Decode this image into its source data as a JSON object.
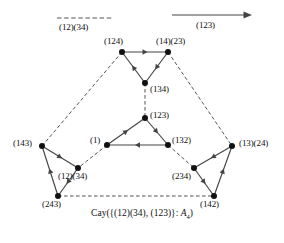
{
  "figure": {
    "caption_prefix": "Cay({(12)(34), (123)}: ",
    "caption_group": "A",
    "caption_sub": "4",
    "caption_suffix": ")",
    "caption_full": "Cay({(12)(34), (123)}: A4)"
  },
  "legend": {
    "dashed": {
      "label": "(12)(34)",
      "style": "dashed-line",
      "meaning": "generator-involution"
    },
    "arrow": {
      "label": "(123)",
      "style": "solid-arrow",
      "meaning": "generator-3-cycle"
    }
  },
  "colors": {
    "edge": "#444444",
    "dashed_edge": "#555555",
    "node": "#111111",
    "text": "#111111",
    "background": "#ffffff"
  },
  "graph": {
    "type": "cayley-graph",
    "group": "A4",
    "vertex_count": 12,
    "vertices": [
      {
        "id": "v124",
        "label": "(124)",
        "x": 122,
        "y": 52,
        "label_x": 104,
        "label_y": 36
      },
      {
        "id": "v1423",
        "label": "(14)(23)",
        "x": 168,
        "y": 52,
        "label_x": 156,
        "label_y": 36
      },
      {
        "id": "v134",
        "label": "(134)",
        "x": 145,
        "y": 83,
        "label_x": 150,
        "label_y": 84
      },
      {
        "id": "v123",
        "label": "(123)",
        "x": 145,
        "y": 118,
        "label_x": 150,
        "label_y": 110
      },
      {
        "id": "v1",
        "label": "(1)",
        "x": 107,
        "y": 145,
        "label_x": 90,
        "label_y": 135
      },
      {
        "id": "v132",
        "label": "(132)",
        "x": 168,
        "y": 145,
        "label_x": 172,
        "label_y": 135
      },
      {
        "id": "v143",
        "label": "(143)",
        "x": 42,
        "y": 146,
        "label_x": 13,
        "label_y": 138
      },
      {
        "id": "v1234",
        "label": "(12)(34)",
        "x": 78,
        "y": 168,
        "label_x": 58,
        "label_y": 171
      },
      {
        "id": "v243",
        "label": "(243)",
        "x": 58,
        "y": 196,
        "label_x": 42,
        "label_y": 199
      },
      {
        "id": "v1324",
        "label": "(13)(24)",
        "x": 232,
        "y": 146,
        "label_x": 239,
        "label_y": 138
      },
      {
        "id": "v234",
        "label": "(234)",
        "x": 194,
        "y": 168,
        "label_x": 172,
        "label_y": 171
      },
      {
        "id": "v142",
        "label": "(142)",
        "x": 214,
        "y": 196,
        "label_x": 200,
        "label_y": 199
      }
    ],
    "dashed_edges": [
      {
        "from": "v134",
        "to": "v123",
        "generator": "(12)(34)"
      },
      {
        "from": "v124",
        "to": "v143",
        "generator": "(12)(34)"
      },
      {
        "from": "v1423",
        "to": "v1324",
        "generator": "(12)(34)"
      },
      {
        "from": "v1",
        "to": "v1234",
        "generator": "(12)(34)"
      },
      {
        "from": "v132",
        "to": "v234",
        "generator": "(12)(34)"
      },
      {
        "from": "v243",
        "to": "v142",
        "generator": "(12)(34)"
      }
    ],
    "directed_edges": [
      {
        "from": "v124",
        "to": "v1423",
        "generator": "(123)"
      },
      {
        "from": "v1423",
        "to": "v134",
        "generator": "(123)"
      },
      {
        "from": "v134",
        "to": "v124",
        "generator": "(123)"
      },
      {
        "from": "v123",
        "to": "v132",
        "generator": "(123)"
      },
      {
        "from": "v132",
        "to": "v1",
        "generator": "(123)"
      },
      {
        "from": "v1",
        "to": "v123",
        "generator": "(123)"
      },
      {
        "from": "v143",
        "to": "v1234",
        "generator": "(123)"
      },
      {
        "from": "v1234",
        "to": "v243",
        "generator": "(123)"
      },
      {
        "from": "v243",
        "to": "v143",
        "generator": "(123)"
      },
      {
        "from": "v1324",
        "to": "v234",
        "generator": "(123)"
      },
      {
        "from": "v234",
        "to": "v142",
        "generator": "(123)"
      },
      {
        "from": "v142",
        "to": "v1324",
        "generator": "(123)"
      }
    ]
  }
}
